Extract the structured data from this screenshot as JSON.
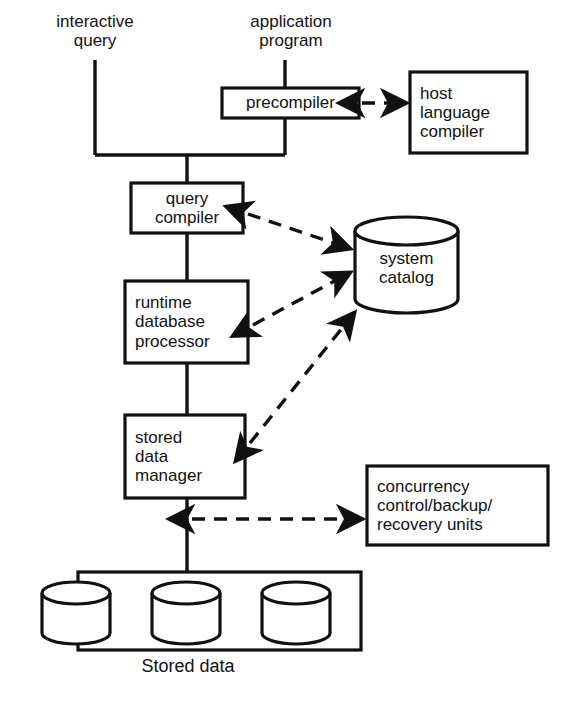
{
  "diagram": {
    "colors": {
      "stroke": "#111111",
      "text": "#121212",
      "background": "#ffffff"
    },
    "input_labels": [
      {
        "id": "interactive-query",
        "text": "interactive\nquery",
        "x": 95,
        "y": 12,
        "font_size": 17
      },
      {
        "id": "application-program",
        "text": "application\nprogram",
        "x": 291,
        "y": 12,
        "font_size": 17
      }
    ],
    "boxes": [
      {
        "id": "precompiler",
        "text": "precompiler",
        "x": 222,
        "y": 88,
        "w": 137,
        "h": 30,
        "font_size": 17,
        "align": "center"
      },
      {
        "id": "host-language-compiler",
        "text": "host\nlanguage\ncompiler",
        "x": 410,
        "y": 72,
        "w": 117,
        "h": 81,
        "font_size": 17,
        "align": "left"
      },
      {
        "id": "query-compiler",
        "text": "query\ncompiler",
        "x": 131,
        "y": 183,
        "w": 112,
        "h": 50,
        "font_size": 17,
        "align": "center"
      },
      {
        "id": "runtime-database-processor",
        "text": "runtime\ndatabase\nprocessor",
        "x": 125,
        "y": 281,
        "w": 123,
        "h": 82,
        "font_size": 17,
        "align": "left"
      },
      {
        "id": "stored-data-manager",
        "text": "stored\ndata\nmanager",
        "x": 125,
        "y": 415,
        "w": 120,
        "h": 83,
        "font_size": 17,
        "align": "left"
      },
      {
        "id": "concurrency-control",
        "text": "concurrency\ncontrol/backup/\nrecovery units",
        "x": 367,
        "y": 466,
        "w": 181,
        "h": 79,
        "font_size": 17,
        "align": "left"
      }
    ],
    "cylinders": [
      {
        "id": "system-catalog",
        "text": "system\ncatalog",
        "x": 355,
        "y": 217,
        "w": 103,
        "h": 96,
        "font_size": 17
      }
    ],
    "stored_data": {
      "container": {
        "id": "stored-data-container",
        "x": 78,
        "y": 572,
        "w": 283,
        "h": 78
      },
      "disks": [
        {
          "id": "stored-data-disk-1",
          "x": 42,
          "y": 582,
          "w": 68,
          "h": 62
        },
        {
          "id": "stored-data-disk-2",
          "x": 152,
          "y": 582,
          "w": 68,
          "h": 62
        },
        {
          "id": "stored-data-disk-3",
          "x": 262,
          "y": 582,
          "w": 68,
          "h": 62
        }
      ],
      "caption": {
        "id": "stored-data-caption",
        "text": "Stored data",
        "x": 188,
        "y": 656,
        "font_size": 18
      }
    },
    "solid_connections": [
      {
        "id": "interactive-query-stem",
        "points": "95,60 95,155"
      },
      {
        "id": "application-program-stem",
        "points": "285,60 285,88"
      },
      {
        "id": "precompiler-down-stem",
        "points": "285,118 285,155"
      },
      {
        "id": "merge-bar",
        "points": "95,155 285,155"
      },
      {
        "id": "merge-to-query-compiler",
        "points": "187,155 187,183"
      },
      {
        "id": "query-to-runtime",
        "points": "187,233 187,281"
      },
      {
        "id": "runtime-to-stored-manager",
        "points": "187,363 187,415"
      },
      {
        "id": "stored-manager-to-disks",
        "points": "187,498 187,572"
      }
    ],
    "dashed_arrows": [
      {
        "id": "arrow-precompiler-host-bidirectional",
        "from": "precompiler",
        "to": "host-language-compiler",
        "path": "M 362,103 L 407,103",
        "heads": "both"
      },
      {
        "id": "arrow-query-compiler-catalog",
        "from": "query-compiler",
        "to": "system-catalog",
        "path": "M 248,214 L 351,249",
        "heads": "both"
      },
      {
        "id": "arrow-runtime-catalog",
        "from": "runtime-database-processor",
        "to": "system-catalog",
        "path": "M 253,325 L 351,272",
        "heads": "both"
      },
      {
        "id": "arrow-stored-manager-catalog",
        "from": "stored-data-manager",
        "to": "system-catalog",
        "path": "M 250,443 L 355,312",
        "heads": "both"
      },
      {
        "id": "arrow-stored-manager-concurrency",
        "from": "stored-data-manager",
        "to": "concurrency-control",
        "path": "M 192,519 L 363,519",
        "heads": "both"
      }
    ],
    "legend": {
      "solid_line_meaning": "access path / control flow",
      "dashed_line_meaning": "data / metadata exchange"
    }
  }
}
